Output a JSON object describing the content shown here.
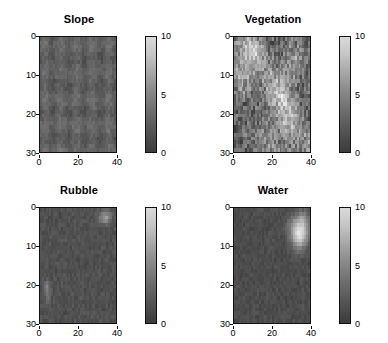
{
  "figure": {
    "background": "#ffffff",
    "layout": "2x2 subplot grid",
    "colormap": "grayscale"
  },
  "chart_data": [
    {
      "type": "heatmap",
      "title": "Slope",
      "xlabel": "",
      "ylabel": "",
      "xlim": [
        0,
        40
      ],
      "ylim": [
        30,
        0
      ],
      "xticks": [
        0,
        20,
        40
      ],
      "yticks": [
        0,
        10,
        20,
        30
      ],
      "grid_cols": 40,
      "grid_rows": 30,
      "colorbar": {
        "min": 0,
        "max": 10,
        "ticks": [
          0,
          5,
          10
        ]
      },
      "value_range_observed": [
        1.2,
        3.4
      ],
      "description": "Nearly uniform dark field, mean value approximately 2 with fine low-amplitude speckle texture throughout.",
      "base_value": 2.0,
      "noise_amplitude": 0.9,
      "seed": 11
    },
    {
      "type": "heatmap",
      "title": "Vegetation",
      "xlabel": "",
      "ylabel": "",
      "xlim": [
        0,
        40
      ],
      "ylim": [
        30,
        0
      ],
      "xticks": [
        0,
        20,
        40
      ],
      "yticks": [
        0,
        10,
        20,
        30
      ],
      "grid_cols": 40,
      "grid_rows": 30,
      "colorbar": {
        "min": 0,
        "max": 10,
        "ticks": [
          0,
          5,
          10
        ]
      },
      "value_range_observed": [
        0.5,
        7.5
      ],
      "description": "Highly heterogeneous field with bright patches clustered along the upper-left edge and a diagonal band of elevated values running from upper-right toward lower-left.",
      "base_value": 2.2,
      "noise_amplitude": 3.8,
      "seed": 23
    },
    {
      "type": "heatmap",
      "title": "Rubble",
      "xlabel": "",
      "ylabel": "",
      "xlim": [
        0,
        40
      ],
      "ylim": [
        30,
        0
      ],
      "xticks": [
        0,
        20,
        40
      ],
      "yticks": [
        0,
        10,
        20,
        30
      ],
      "grid_cols": 40,
      "grid_rows": 30,
      "colorbar": {
        "min": 0,
        "max": 10,
        "ticks": [
          0,
          5,
          10
        ]
      },
      "value_range_observed": [
        0.3,
        5.5
      ],
      "description": "Predominantly very dark field near zero, with a small bright cluster in the upper-right corner and a few isolated bright cells near the left edge around row 20.",
      "base_value": 1.2,
      "noise_amplitude": 0.7,
      "seed": 37
    },
    {
      "type": "heatmap",
      "title": "Water",
      "xlabel": "",
      "ylabel": "",
      "xlim": [
        0,
        40
      ],
      "ylim": [
        30,
        0
      ],
      "xticks": [
        0,
        20,
        40
      ],
      "yticks": [
        0,
        10,
        20,
        30
      ],
      "grid_cols": 40,
      "grid_rows": 30,
      "colorbar": {
        "min": 0,
        "max": 10,
        "ticks": [
          0,
          5,
          10
        ]
      },
      "value_range_observed": [
        0.2,
        9.0
      ],
      "description": "Dark background with one compact bright high-value blob in the upper-right quadrant spanning roughly columns 30-38 and rows 2-11, tapering toward its lower edge.",
      "base_value": 1.0,
      "noise_amplitude": 0.7,
      "seed": 53
    }
  ]
}
